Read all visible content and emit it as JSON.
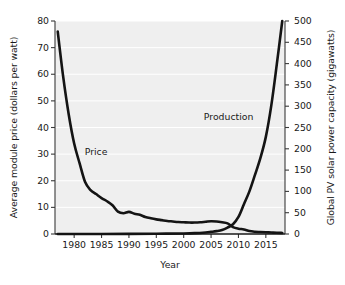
{
  "chart_data": {
    "type": "line",
    "title": "",
    "xlabel": "Year",
    "ylabel": "Average module price (dollars per watt)",
    "ylabel_right": "Global PV solar power capacity (gigawatts)",
    "xlim": [
      1976.5,
      2018.5
    ],
    "ylim": [
      0,
      80
    ],
    "ylim_right": [
      0,
      500
    ],
    "xticks": [
      1980,
      1985,
      1990,
      1995,
      2000,
      2005,
      2010,
      2015
    ],
    "xtick_labels": [
      "1980",
      "1985",
      "1990",
      "1995",
      "2000",
      "2005",
      "2010",
      "2015"
    ],
    "yticks": [
      0,
      10,
      20,
      30,
      40,
      50,
      60,
      70,
      80
    ],
    "ytick_labels": [
      "0",
      "10",
      "20",
      "30",
      "40",
      "50",
      "60",
      "70",
      "80"
    ],
    "yticks_right": [
      0,
      50,
      100,
      150,
      200,
      250,
      300,
      350,
      400,
      450,
      500
    ],
    "ytick_labels_right": [
      "0",
      "50",
      "100",
      "150",
      "200",
      "250",
      "300",
      "350",
      "400",
      "450",
      "500"
    ],
    "grid": true,
    "grid_color": "#ffffff",
    "plot_background": "#efefef",
    "line_color": "#141414",
    "legend": "none",
    "annotations": [
      {
        "text": "Price",
        "x": 1984.0,
        "y": 31.0
      },
      {
        "text": "Production",
        "x": 2008.2,
        "y": 44.5
      }
    ],
    "series": [
      {
        "name": "Price",
        "axis": "left",
        "units": "dollars per watt",
        "x": [
          1977,
          1978,
          1979,
          1980,
          1981,
          1982,
          1983,
          1984,
          1985,
          1986,
          1987,
          1988,
          1989,
          1990,
          1991,
          1992,
          1993,
          1994,
          1995,
          1996,
          1997,
          1998,
          1999,
          2000,
          2001,
          2002,
          2003,
          2004,
          2005,
          2006,
          2007,
          2008,
          2009,
          2010,
          2011,
          2012,
          2013,
          2014,
          2015,
          2016,
          2017,
          2018
        ],
        "values": [
          76.0,
          59.0,
          45.0,
          34.0,
          26.5,
          19.5,
          16.5,
          15.0,
          13.5,
          12.3,
          10.8,
          8.4,
          7.8,
          8.3,
          7.6,
          7.2,
          6.4,
          5.9,
          5.5,
          5.2,
          4.9,
          4.7,
          4.5,
          4.4,
          4.3,
          4.3,
          4.4,
          4.6,
          4.8,
          4.7,
          4.4,
          4.0,
          2.6,
          2.0,
          1.7,
          1.1,
          0.85,
          0.75,
          0.65,
          0.55,
          0.45,
          0.4
        ]
      },
      {
        "name": "Production",
        "axis": "right",
        "units": "gigawatts",
        "x": [
          1977,
          1980,
          1985,
          1990,
          1995,
          2000,
          2002,
          2004,
          2005,
          2006,
          2007,
          2008,
          2009,
          2010,
          2011,
          2012,
          2013,
          2014,
          2015,
          2016,
          2017,
          2018
        ],
        "values": [
          0.0,
          0.0,
          0.0,
          0.2,
          0.6,
          1.3,
          2.0,
          3.7,
          5.1,
          6.7,
          9.2,
          15.0,
          23.0,
          40.0,
          70.0,
          100.0,
          138.0,
          178.0,
          228.0,
          302.0,
          398.0,
          500.0
        ]
      }
    ]
  }
}
